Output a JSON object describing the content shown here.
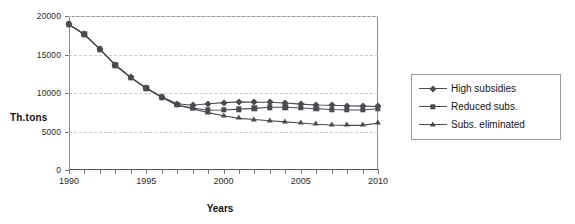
{
  "chart_data": {
    "type": "line",
    "title": "",
    "xlabel": "Years",
    "ylabel": "Th.tons",
    "x": [
      1990,
      1991,
      1992,
      1993,
      1994,
      1995,
      1996,
      1997,
      1998,
      1999,
      2000,
      2001,
      2002,
      2003,
      2004,
      2005,
      2006,
      2007,
      2008,
      2009,
      2010
    ],
    "xlim": [
      1990,
      2010
    ],
    "ylim": [
      0,
      20000
    ],
    "xticks": [
      1990,
      1991,
      1992,
      1993,
      1994,
      1995,
      1996,
      1997,
      1998,
      1999,
      2000,
      2001,
      2002,
      2003,
      2004,
      2005,
      2006,
      2007,
      2008,
      2009,
      2010
    ],
    "xtick_labels": [
      "1990",
      "",
      "",
      "",
      "",
      "1995",
      "",
      "",
      "",
      "",
      "2000",
      "",
      "",
      "",
      "",
      "2005",
      "",
      "",
      "",
      "",
      "2010"
    ],
    "yticks": [
      0,
      5000,
      10000,
      15000,
      20000
    ],
    "ytick_labels": [
      "0",
      "5000",
      "10000",
      "15000",
      "20000"
    ],
    "grid": "horizontal-dashed",
    "legend_position": "right-outside",
    "series": [
      {
        "name": "High subsidies",
        "marker": "diamond",
        "color": "#4a4a52",
        "values": [
          18900,
          17600,
          15700,
          13650,
          12050,
          10650,
          9500,
          8600,
          8400,
          8600,
          8750,
          8850,
          8800,
          8800,
          8700,
          8550,
          8450,
          8400,
          8350,
          8300,
          8250
        ]
      },
      {
        "name": "Reduced subs.",
        "marker": "square",
        "color": "#4a4a52",
        "values": [
          18900,
          17600,
          15700,
          13600,
          12000,
          10600,
          9450,
          8450,
          8050,
          7750,
          7800,
          7900,
          8000,
          8150,
          8150,
          8050,
          7950,
          7850,
          7800,
          7800,
          7950
        ]
      },
      {
        "name": "Subs. eliminated",
        "marker": "triangle",
        "color": "#4a4a52",
        "values": [
          18900,
          17600,
          15700,
          13600,
          12000,
          10600,
          9450,
          8400,
          7950,
          7450,
          7050,
          6700,
          6550,
          6400,
          6250,
          6100,
          5950,
          5850,
          5800,
          5800,
          6100
        ]
      }
    ]
  },
  "legend": {
    "items": [
      {
        "label": "High subsidies",
        "marker": "diamond"
      },
      {
        "label": "Reduced subs.",
        "marker": "square"
      },
      {
        "label": "Subs. eliminated",
        "marker": "triangle"
      }
    ]
  },
  "colors": {
    "series": "#4a4a52",
    "grid": "#c9c9c9",
    "frame": "#8a8a8a",
    "text": "#1d1d1d",
    "background": "#ffffff"
  }
}
